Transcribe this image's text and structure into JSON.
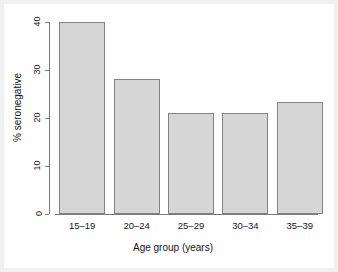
{
  "chart_data": {
    "type": "bar",
    "title": "",
    "subtitle": "",
    "xlabel": "Age group (years)",
    "ylabel": "% seronegative",
    "categories": [
      "15–19",
      "20–24",
      "25–29",
      "30–34",
      "35–39"
    ],
    "values": [
      40.0,
      28.2,
      21.0,
      21.1,
      23.4
    ],
    "series": [
      {
        "name": "% seronegative",
        "values": [
          40.0,
          28.2,
          21.0,
          21.1,
          23.4
        ]
      }
    ],
    "ylim": [
      0,
      40
    ],
    "xlim": [
      0,
      5
    ],
    "yticks": [
      0,
      10,
      20,
      30,
      40
    ],
    "ytick_labels": [
      "0",
      "10",
      "20",
      "30",
      "40"
    ],
    "grid": false,
    "legend": null,
    "legend_position": "none",
    "bar_fill_color": "#d6d6d6",
    "bar_border_color": "#828282",
    "axis_color": "#7a7a7a",
    "background_color": "#ffffff",
    "text_color": "#151515",
    "annotations": []
  },
  "figure": {
    "outer_border_color": "#f1f1f1"
  }
}
